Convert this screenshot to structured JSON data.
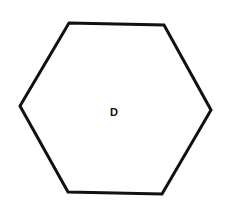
{
  "diagram": {
    "shape": "hexagon",
    "label": "D",
    "stroke_color": "#111111",
    "fill_color": "#ffffff",
    "stroke_width": 3,
    "vertices": [
      [
        69,
        23
      ],
      [
        164,
        25
      ],
      [
        211,
        110
      ],
      [
        162,
        194
      ],
      [
        68,
        192
      ],
      [
        20,
        106
      ]
    ],
    "label_position": [
      114,
      116
    ]
  }
}
